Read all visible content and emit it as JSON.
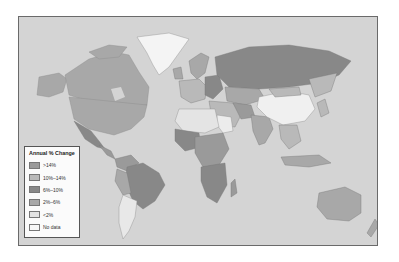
{
  "map": {
    "type": "world choropleth",
    "ocean_color": "#d4d4d4",
    "border_color": "#6a6a6a"
  },
  "legend": {
    "title": "Annual % Change",
    "items": [
      {
        "label": ">14%",
        "color": "#9a9a9a"
      },
      {
        "label": "10%–14%",
        "color": "#b9b9b9"
      },
      {
        "label": "6%–10%",
        "color": "#888888"
      },
      {
        "label": "2%–6%",
        "color": "#a8a8a8"
      },
      {
        "label": "<2%",
        "color": "#e4e4e4"
      },
      {
        "label": "No data",
        "color": "#f7f7f7"
      }
    ]
  },
  "regions": {
    "greenland": {
      "class": "<2%"
    },
    "north_america": {
      "class": "2%–6%"
    },
    "russia": {
      "class": "6%–10%"
    },
    "china": {
      "class": "<2%"
    },
    "south_america_brazil": {
      "class": "6%–10%"
    },
    "argentina": {
      "class": "<2%"
    },
    "australia": {
      "class": "2%–6%"
    },
    "africa_south": {
      "class": "6%–10%"
    },
    "india": {
      "class": "2%–6%"
    }
  }
}
